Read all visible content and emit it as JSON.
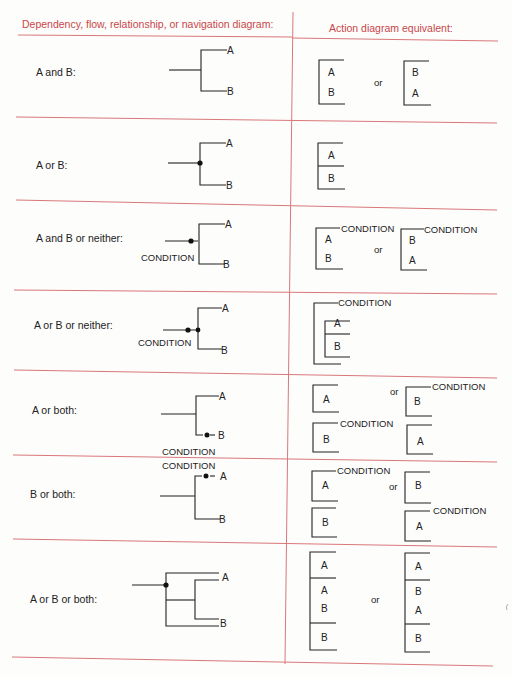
{
  "header": {
    "left": "Dependency, flow, relationship, or navigation diagram:",
    "right": "Action diagram equivalent:"
  },
  "colors": {
    "rule": "#d9777a",
    "header_text": "#c9464a",
    "ink": "#222222"
  },
  "rows": [
    {
      "label": "A and B:",
      "or": "or",
      "branches": [
        "A",
        "B"
      ]
    },
    {
      "label": "A or B:",
      "branches": [
        "A",
        "B"
      ]
    },
    {
      "label": "A and B or neither:",
      "or": "or",
      "condition": "CONDITION",
      "branches": [
        "A",
        "B"
      ]
    },
    {
      "label": "A or B or neither:",
      "condition": "CONDITION",
      "branches": [
        "A",
        "B"
      ]
    },
    {
      "label": "A or both:",
      "or": "or",
      "condition": "CONDITION",
      "branches": [
        "A",
        "B"
      ]
    },
    {
      "label": "B or both:",
      "or": "or",
      "condition": "CONDITION",
      "branches": [
        "A",
        "B"
      ]
    },
    {
      "label": "A or B or both:",
      "or": "or",
      "branches": [
        "A",
        "B"
      ]
    }
  ],
  "glyphs": {
    "A": "A",
    "B": "B",
    "COND": "CONDITION"
  }
}
